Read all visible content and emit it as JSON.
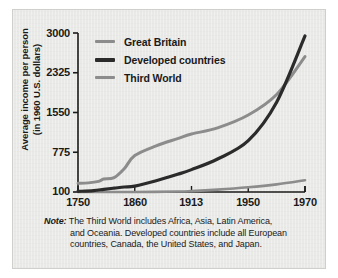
{
  "chart_data": {
    "type": "line",
    "title": "",
    "xlabel": "",
    "ylabel": "Average income per person (in 1960 U.S. dollars)",
    "ylabel_line1": "Average income per person",
    "ylabel_line2": "(in 1960 U.S. dollars)",
    "x": [
      1750,
      1860,
      1913,
      1950,
      1970
    ],
    "xticklabels": [
      "1750",
      "1860",
      "1913",
      "1950",
      "1970"
    ],
    "yticks": [
      100,
      775,
      1550,
      2325,
      3000
    ],
    "yticklabels": [
      "100",
      "775",
      "1550",
      "2325",
      "3000"
    ],
    "ylim": [
      100,
      3000
    ],
    "grid": false,
    "legend_position": "top-left",
    "series": [
      {
        "name": "Great Britain",
        "color": "#8c8c8c",
        "values": [
          250,
          720,
          1130,
          1500,
          2600
        ],
        "points": [
          [
            1750,
            250
          ],
          [
            1770,
            255
          ],
          [
            1790,
            280
          ],
          [
            1800,
            320
          ],
          [
            1820,
            345
          ],
          [
            1840,
            500
          ],
          [
            1860,
            720
          ],
          [
            1880,
            900
          ],
          [
            1900,
            1040
          ],
          [
            1913,
            1130
          ],
          [
            1930,
            1250
          ],
          [
            1950,
            1500
          ],
          [
            1960,
            1900
          ],
          [
            1970,
            2600
          ]
        ]
      },
      {
        "name": "Developed countries",
        "color": "#2b2b2b",
        "values": [
          110,
          200,
          480,
          1000,
          2950
        ],
        "points": [
          [
            1750,
            110
          ],
          [
            1780,
            125
          ],
          [
            1800,
            145
          ],
          [
            1820,
            165
          ],
          [
            1840,
            185
          ],
          [
            1860,
            200
          ],
          [
            1880,
            290
          ],
          [
            1900,
            400
          ],
          [
            1913,
            480
          ],
          [
            1930,
            660
          ],
          [
            1950,
            1000
          ],
          [
            1960,
            1750
          ],
          [
            1970,
            2950
          ]
        ]
      },
      {
        "name": "Third World",
        "color": "#8c8c8c",
        "values": [
          100,
          100,
          115,
          180,
          300
        ],
        "points": [
          [
            1750,
            100
          ],
          [
            1800,
            100
          ],
          [
            1860,
            100
          ],
          [
            1900,
            108
          ],
          [
            1913,
            115
          ],
          [
            1930,
            140
          ],
          [
            1950,
            180
          ],
          [
            1960,
            230
          ],
          [
            1970,
            300
          ]
        ]
      }
    ]
  },
  "legend": {
    "items": [
      {
        "label": "Great Britain",
        "color": "#8c8c8c",
        "thickness": 3
      },
      {
        "label": "Developed countries",
        "color": "#2b2b2b",
        "thickness": 4
      },
      {
        "label": "Third World",
        "color": "#8c8c8c",
        "thickness": 3
      }
    ]
  },
  "axis": {
    "y_labels": [
      "3000",
      "2325",
      "1550",
      "775",
      "100"
    ],
    "x_labels": [
      "1750",
      "1860",
      "1913",
      "1950",
      "1970"
    ],
    "y_title_line1": "Average income per person",
    "y_title_line2": "(in 1960 U.S. dollars)"
  },
  "note": {
    "label": "Note:",
    "line1": "The Third World includes Africa, Asia, Latin America,",
    "line2": "and Oceania. Developed countries include all European",
    "line3": "countries, Canada, the United States, and Japan."
  },
  "colors": {
    "page_background": "#ffffff",
    "panel_background": "#e9e9e7",
    "panel_border": "#cfcfcb",
    "axis": "#1a1a1a",
    "text": "#1a1a1a",
    "great_britain": "#8c8c8c",
    "developed_countries": "#2b2b2b",
    "third_world": "#8c8c8c"
  }
}
